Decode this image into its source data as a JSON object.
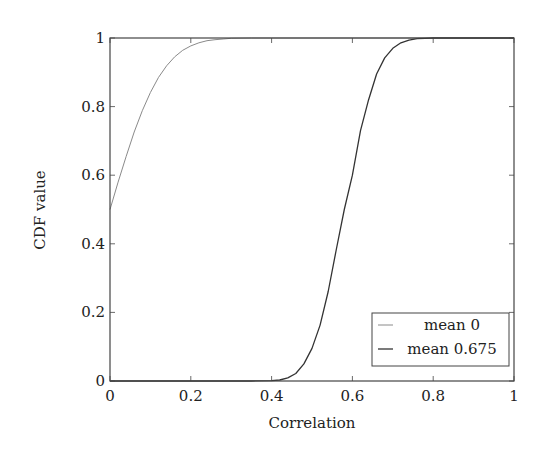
{
  "chart_data": {
    "type": "line",
    "title": "",
    "xlabel": "Correlation",
    "ylabel": "CDF value",
    "xlim": [
      0,
      1
    ],
    "ylim": [
      0,
      1
    ],
    "xticks": [
      "0",
      "0.2",
      "0.4",
      "0.6",
      "0.8",
      "1"
    ],
    "yticks": [
      "0",
      "0.2",
      "0.4",
      "0.6",
      "0.8",
      "1"
    ],
    "grid": false,
    "legend_position": "lower right",
    "series": [
      {
        "name": "mean 0",
        "color": "#8a8a8a",
        "x": [
          0,
          0.02,
          0.04,
          0.06,
          0.08,
          0.1,
          0.12,
          0.14,
          0.16,
          0.18,
          0.2,
          0.22,
          0.24,
          0.26,
          0.28,
          0.3,
          0.35,
          0.4,
          1.0
        ],
        "y": [
          0.5,
          0.58,
          0.655,
          0.726,
          0.788,
          0.841,
          0.885,
          0.919,
          0.945,
          0.964,
          0.977,
          0.986,
          0.992,
          0.995,
          0.997,
          0.999,
          1.0,
          1.0,
          1.0
        ]
      },
      {
        "name": "mean 0.675",
        "color": "#333333",
        "x": [
          0,
          0.35,
          0.4,
          0.42,
          0.44,
          0.46,
          0.48,
          0.5,
          0.52,
          0.54,
          0.56,
          0.58,
          0.6,
          0.62,
          0.64,
          0.66,
          0.68,
          0.7,
          0.72,
          0.74,
          0.76,
          0.78,
          0.8,
          1.0
        ],
        "y": [
          0.0,
          0.0,
          0.001,
          0.003,
          0.009,
          0.022,
          0.05,
          0.095,
          0.163,
          0.261,
          0.382,
          0.5,
          0.6,
          0.73,
          0.82,
          0.895,
          0.942,
          0.97,
          0.986,
          0.994,
          0.998,
          0.999,
          1.0,
          1.0
        ]
      }
    ]
  },
  "legend": {
    "items": [
      {
        "label": "mean 0"
      },
      {
        "label": "mean 0.675"
      }
    ]
  },
  "axes": {
    "xlabel": "Correlation",
    "ylabel": "CDF value"
  }
}
